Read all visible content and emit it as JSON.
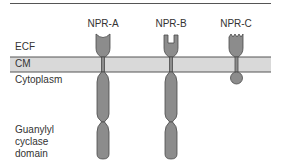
{
  "figure": {
    "receptors": [
      {
        "name": "NPR-A",
        "x": 103,
        "ligand_site": "concave-cup",
        "has_guanylyl_cyclase": true
      },
      {
        "name": "NPR-B",
        "x": 171,
        "ligand_site": "notched-slot",
        "has_guanylyl_cyclase": true
      },
      {
        "name": "NPR-C",
        "x": 236,
        "ligand_site": "zigzag",
        "has_guanylyl_cyclase": false
      }
    ],
    "regions": {
      "ecf": "ECF",
      "cm": "CM",
      "cytoplasm": "Cytoplasm"
    },
    "domain_label": {
      "line1": "Guanylyl",
      "line2": "cyclase",
      "line3": "domain"
    },
    "colors": {
      "membrane_fill": "#d9d9d9",
      "membrane_edge": "#555555",
      "receptor_fill": "#8c8c8c",
      "receptor_edge": "#4a4a4a"
    }
  }
}
